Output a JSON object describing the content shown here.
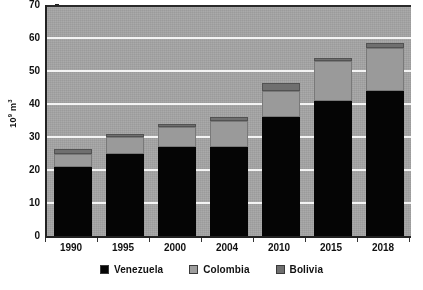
{
  "chart_data": {
    "type": "bar",
    "subtype": "stacked-bar",
    "title": "",
    "xlabel": "",
    "ylabel": "10⁹ m³",
    "ylabel_base": "10",
    "ylabel_exp": "9",
    "ylabel_unit": "m",
    "ylabel_unit_exp": "3",
    "ylim": [
      0,
      70
    ],
    "ytick_step": 10,
    "ytick_labels": [
      "0",
      "10",
      "20",
      "30",
      "40",
      "50",
      "60",
      "70"
    ],
    "ytick_values": [
      0,
      10,
      20,
      30,
      40,
      50,
      60,
      70
    ],
    "grid": true,
    "grid_color": "#f4f4f4",
    "plot_background": "#a2a2a2",
    "legend_position": "bottom",
    "categories": [
      "1990",
      "1995",
      "2000",
      "2004",
      "2010",
      "2015",
      "2018"
    ],
    "series": [
      {
        "name": "Venezuela",
        "color": "#050505",
        "values": [
          21,
          25,
          27,
          27,
          36,
          41,
          44
        ]
      },
      {
        "name": "Colombia",
        "color": "#9e9e9e",
        "values": [
          4,
          5,
          6,
          8,
          8,
          12,
          13
        ]
      },
      {
        "name": "Bolivia",
        "color": "#6f6f6f",
        "values": [
          1.5,
          1,
          1,
          1,
          2.5,
          1,
          1.5
        ]
      }
    ],
    "totals": [
      26.5,
      31,
      34,
      36,
      46.5,
      54,
      58.5
    ]
  },
  "legend": {
    "items": [
      {
        "label": "Venezuela",
        "swatch_class": "sw-venezuela"
      },
      {
        "label": "Colombia",
        "swatch_class": "sw-colombia"
      },
      {
        "label": "Bolivia",
        "swatch_class": "sw-bolivia"
      }
    ]
  }
}
